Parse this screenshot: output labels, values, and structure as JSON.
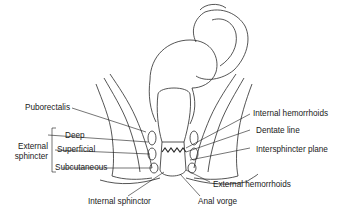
{
  "diagram": {
    "labels_left": {
      "puborectalis": "Puborectalis",
      "group_title_1": "External",
      "group_title_2": "sphincter",
      "deep": "Deep",
      "superficial": "Superficial",
      "subcutaneous": "Subcutaneous"
    },
    "labels_right": {
      "internal_hemorrhoids": "Internal hemorrhoids",
      "dentate_line": "Dentate line",
      "intersphincter_plane": "Intersphincter plane",
      "external_hemorrhoids": "External hemorrhoids"
    },
    "labels_bottom": {
      "internal_sphincter": "Internal sphinctor",
      "anal_verge": "Anal vorge"
    },
    "colors": {
      "ink": "#1a1a1a",
      "background": "#ffffff",
      "shade": "#bdbdbd"
    }
  }
}
